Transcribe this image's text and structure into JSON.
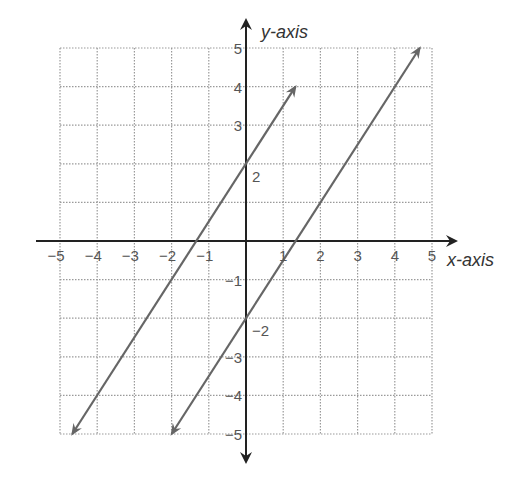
{
  "chart_data": {
    "type": "line",
    "title": "",
    "xlabel": "x-axis",
    "ylabel": "y-axis",
    "xlim": [
      -5,
      5
    ],
    "ylim": [
      -5,
      5
    ],
    "grid": true,
    "grid_style": "dotted",
    "x_ticks": [
      "-5",
      "-4",
      "-3",
      "-2",
      "-1",
      "1",
      "2",
      "3",
      "4",
      "5"
    ],
    "y_ticks": [
      "5",
      "4",
      "3",
      "-1",
      "-3",
      "-4",
      "-5"
    ],
    "annotations": [
      {
        "text": "2",
        "x": 0,
        "y": 2,
        "note": "y-intercept of upper line"
      },
      {
        "text": "-2",
        "x": 0,
        "y": -2,
        "note": "y-intercept of lower line"
      }
    ],
    "series": [
      {
        "name": "line-1",
        "equation": "y = 1.5x + 2",
        "slope": 1.5,
        "intercept": 2,
        "x": [
          -4.67,
          1.33
        ],
        "y": [
          -5,
          4.0
        ],
        "arrows": "both",
        "color": "#666666"
      },
      {
        "name": "line-2",
        "equation": "y = 1.5x - 2",
        "slope": 1.5,
        "intercept": -2,
        "x": [
          -2,
          4.67
        ],
        "y": [
          -5,
          5
        ],
        "arrows": "both",
        "color": "#666666"
      }
    ],
    "legend": null
  },
  "colors": {
    "axis": "#222222",
    "grid": "#9a9a9a",
    "line": "#666666",
    "text": "#555555"
  }
}
